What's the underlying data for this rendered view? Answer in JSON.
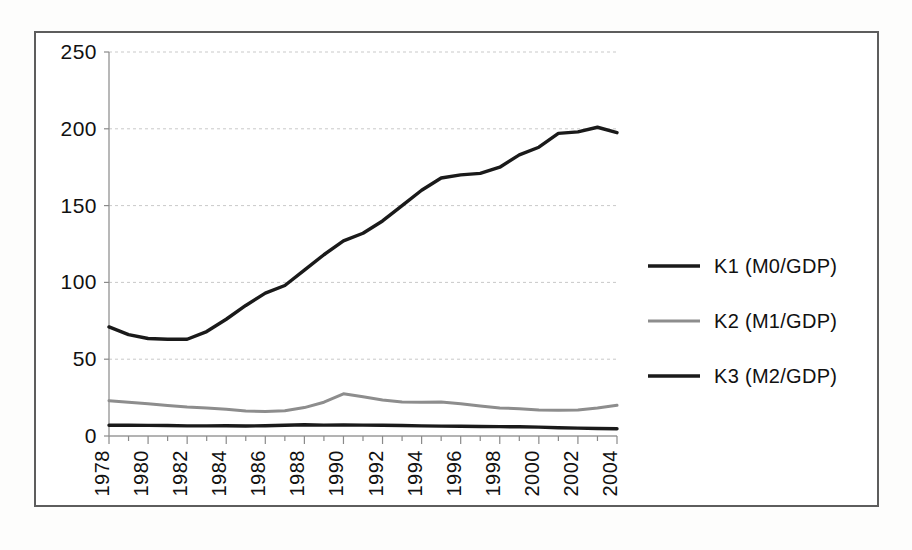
{
  "figure": {
    "background_color": "#ffffff",
    "frame_color": "#5d5d5d",
    "grid_color": "#c9c9c9",
    "axis_color": "#9a9a9a"
  },
  "legend": {
    "position": "right",
    "entries": [
      {
        "label": "K1 (M0/GDP)",
        "color": "#1a1a1a",
        "width": 3.4
      },
      {
        "label": "K2 (M1/GDP)",
        "color": "#8d8d8d",
        "width": 3.0
      },
      {
        "label": "K3 (M2/GDP)",
        "color": "#1a1a1a",
        "width": 3.4
      }
    ]
  },
  "chart_data": {
    "type": "line",
    "title": "",
    "subtitle": "",
    "xlabel": "",
    "ylabel": "",
    "grid": true,
    "legend_position": "right",
    "x": [
      1978,
      1979,
      1980,
      1981,
      1982,
      1983,
      1984,
      1985,
      1986,
      1987,
      1988,
      1989,
      1990,
      1991,
      1992,
      1993,
      1994,
      1995,
      1996,
      1997,
      1998,
      1999,
      2000,
      2001,
      2002,
      2003,
      2004
    ],
    "xlim": [
      1978,
      2004
    ],
    "ylim": [
      0,
      250
    ],
    "yticks": [
      0,
      50,
      100,
      150,
      200,
      250
    ],
    "xtick_labels": [
      "1978",
      "1980",
      "1982",
      "1984",
      "1986",
      "1988",
      "1990",
      "1992",
      "1994",
      "1996",
      "1998",
      "2000",
      "2002",
      "2004"
    ],
    "xticks": [
      1978,
      1980,
      1982,
      1984,
      1986,
      1988,
      1990,
      1992,
      1994,
      1996,
      1998,
      2000,
      2002,
      2004
    ],
    "xtick_rotation": 90,
    "series": [
      {
        "name": "K1 (M0/GDP)",
        "color": "#1a1a1a",
        "width": 3.4,
        "values": [
          7.0,
          7.0,
          6.9,
          6.8,
          6.6,
          6.6,
          6.7,
          6.5,
          6.7,
          7.0,
          7.3,
          7.1,
          7.2,
          7.1,
          7.0,
          6.8,
          6.6,
          6.4,
          6.3,
          6.2,
          6.1,
          6.0,
          5.8,
          5.4,
          5.1,
          4.9,
          4.7
        ]
      },
      {
        "name": "K2 (M1/GDP)",
        "color": "#8d8d8d",
        "width": 3.0,
        "values": [
          23.0,
          22.0,
          21.0,
          19.8,
          18.8,
          18.2,
          17.4,
          16.3,
          16.0,
          16.4,
          18.5,
          22.0,
          27.5,
          25.5,
          23.5,
          22.2,
          22.0,
          22.2,
          21.0,
          19.5,
          18.2,
          17.8,
          17.0,
          16.8,
          17.0,
          18.2,
          20.0
        ]
      },
      {
        "name": "K3 (M2/GDP)",
        "color": "#1a1a1a",
        "width": 3.4,
        "values": [
          71.0,
          66.0,
          63.5,
          63.0,
          63.0,
          68.0,
          76.0,
          85.0,
          93.0,
          98.0,
          108.0,
          118.0,
          127.0,
          132.0,
          140.0,
          150.0,
          160.0,
          168.0,
          170.0,
          171.0,
          175.0,
          183.0,
          188.0,
          197.0,
          198.0,
          201.0,
          197.5
        ]
      }
    ]
  }
}
